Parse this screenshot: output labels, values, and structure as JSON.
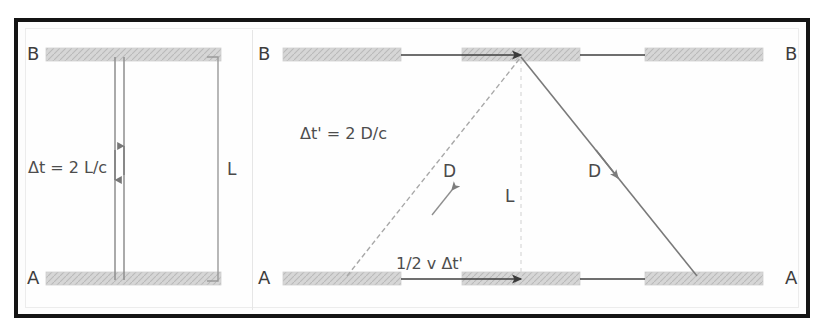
{
  "figure": {
    "background_color": "#ffffff",
    "frame_color": "#141414",
    "mirror_color": "#d2d2d2",
    "ray_color": "#6e6e6e",
    "text_color": "#4a4a4a"
  },
  "left_panel": {
    "name": "rest-frame-light-clock",
    "top_mirror_label": "B",
    "bottom_mirror_label": "A",
    "equation_label": "Δt = 2 L/c",
    "dimension_label": "L",
    "ray_down_direction": "down",
    "ray_up_direction": "up"
  },
  "right_panel": {
    "name": "moving-frame-light-clock",
    "top_mirror_label_left": "B",
    "top_mirror_label_right": "B",
    "bottom_mirror_label_left": "A",
    "bottom_mirror_label_right": "A",
    "equation_label": "Δt' = 2 D/c",
    "diagonal_label_ascending": "D",
    "diagonal_label_descending": "D",
    "vertical_label": "L",
    "horizontal_label": "1/2 v Δt'"
  }
}
